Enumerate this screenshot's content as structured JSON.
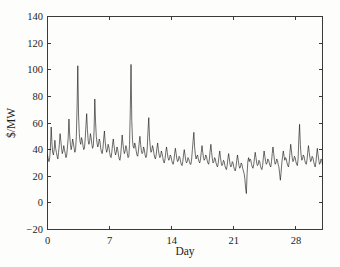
{
  "chart_data": {
    "type": "line",
    "title": "",
    "xlabel": "Day",
    "ylabel": "$/MW",
    "xlim": [
      0,
      31
    ],
    "ylim": [
      -20,
      140
    ],
    "xticks": [
      0,
      7,
      14,
      21,
      28
    ],
    "xticklabels": [
      "0",
      "7",
      "14",
      "21",
      "28"
    ],
    "yticks": [
      -20,
      0,
      20,
      40,
      60,
      80,
      100,
      120,
      140
    ],
    "yticklabels": [
      "-20",
      "0",
      "20",
      "40",
      "60",
      "80",
      "100",
      "120",
      "140"
    ],
    "grid": false,
    "legend": null,
    "legend_position": "none",
    "series": [
      {
        "name": "Electricity spot price",
        "color": "#121212",
        "x_start": 0,
        "x_step": 0.08333333,
        "values": [
          36,
          33,
          31,
          34,
          42,
          57,
          45,
          38,
          36,
          40,
          47,
          41,
          38,
          35,
          33,
          38,
          44,
          52,
          47,
          41,
          37,
          39,
          43,
          40,
          37,
          34,
          36,
          42,
          49,
          63,
          51,
          44,
          40,
          43,
          48,
          45,
          41,
          38,
          40,
          50,
          72,
          103,
          66,
          52,
          46,
          44,
          49,
          47,
          43,
          40,
          41,
          48,
          58,
          67,
          55,
          47,
          44,
          46,
          52,
          49,
          44,
          41,
          43,
          54,
          78,
          61,
          50,
          45,
          42,
          44,
          48,
          46,
          41,
          38,
          37,
          41,
          48,
          54,
          46,
          41,
          38,
          40,
          44,
          42,
          38,
          35,
          34,
          38,
          44,
          48,
          43,
          39,
          36,
          38,
          42,
          40,
          36,
          33,
          32,
          36,
          43,
          51,
          45,
          40,
          37,
          39,
          43,
          41,
          37,
          34,
          35,
          44,
          70,
          104,
          62,
          47,
          42,
          41,
          45,
          43,
          39,
          36,
          35,
          39,
          45,
          50,
          44,
          39,
          37,
          38,
          42,
          40,
          36,
          34,
          35,
          42,
          55,
          64,
          49,
          42,
          38,
          39,
          43,
          41,
          37,
          34,
          33,
          36,
          41,
          45,
          40,
          36,
          34,
          35,
          39,
          37,
          34,
          31,
          30,
          33,
          38,
          42,
          38,
          34,
          32,
          33,
          36,
          35,
          32,
          30,
          29,
          32,
          37,
          41,
          37,
          33,
          31,
          32,
          35,
          34,
          31,
          29,
          28,
          31,
          36,
          40,
          36,
          32,
          30,
          31,
          34,
          33,
          31,
          29,
          29,
          33,
          40,
          47,
          53,
          42,
          36,
          33,
          35,
          36,
          33,
          31,
          30,
          33,
          38,
          43,
          38,
          34,
          32,
          33,
          36,
          35,
          32,
          30,
          29,
          33,
          39,
          44,
          38,
          33,
          30,
          31,
          34,
          33,
          30,
          28,
          27,
          30,
          35,
          39,
          34,
          30,
          28,
          29,
          32,
          31,
          28,
          26,
          25,
          28,
          33,
          37,
          33,
          29,
          27,
          28,
          31,
          30,
          27,
          25,
          24,
          27,
          32,
          36,
          32,
          28,
          26,
          27,
          30,
          29,
          26,
          24,
          22,
          18,
          11,
          7,
          22,
          31,
          34,
          31,
          33,
          32,
          29,
          27,
          26,
          29,
          34,
          38,
          34,
          30,
          28,
          29,
          32,
          31,
          28,
          26,
          25,
          28,
          34,
          39,
          35,
          31,
          29,
          30,
          33,
          32,
          30,
          28,
          27,
          31,
          37,
          42,
          37,
          32,
          29,
          30,
          33,
          32,
          29,
          27,
          22,
          17,
          23,
          30,
          35,
          39,
          35,
          32,
          34,
          33,
          30,
          28,
          27,
          31,
          38,
          44,
          39,
          34,
          31,
          32,
          35,
          34,
          31,
          29,
          28,
          33,
          48,
          59,
          44,
          36,
          32,
          33,
          36,
          35,
          32,
          30,
          29,
          32,
          38,
          43,
          38,
          34,
          31,
          32,
          35,
          34,
          31,
          29,
          27,
          30,
          36,
          41,
          36,
          32,
          29,
          30,
          33,
          32,
          29,
          27,
          24,
          20,
          16,
          23,
          32,
          38,
          34,
          31,
          33,
          32,
          29,
          28,
          29,
          37,
          56,
          79,
          52,
          40,
          35,
          34,
          37,
          36,
          33,
          31,
          30,
          34,
          41,
          47,
          41,
          36,
          33,
          34,
          37,
          36,
          33,
          31,
          30,
          35,
          44,
          51,
          44,
          38,
          34,
          35,
          38,
          37,
          34,
          32,
          33,
          45,
          70,
          93,
          60,
          44,
          38,
          37,
          40,
          39,
          36,
          33,
          32,
          36,
          43,
          49,
          43,
          38,
          35,
          36,
          39,
          38,
          35,
          33,
          34,
          47,
          72,
          93,
          61,
          45,
          39,
          38,
          41,
          40,
          37,
          34,
          33,
          37,
          44,
          50,
          44,
          39,
          36,
          37,
          40,
          39,
          35,
          32,
          29,
          23,
          14,
          5,
          1,
          18,
          31,
          36,
          38,
          37,
          34,
          32,
          33,
          41,
          58,
          66,
          50,
          42,
          38,
          37,
          40,
          39,
          36,
          34,
          36,
          52,
          84,
          117,
          73,
          52,
          44,
          41,
          44,
          43,
          40,
          37,
          36,
          40,
          47,
          53,
          47,
          41,
          38,
          39,
          42,
          41,
          38,
          36,
          37,
          48,
          66,
          86,
          59,
          46,
          41,
          40,
          43,
          42,
          39,
          37,
          38,
          46,
          62,
          76,
          55,
          44,
          40,
          39,
          42,
          41,
          38,
          36,
          35,
          39,
          46,
          52,
          46,
          41,
          38,
          39,
          42,
          41,
          38,
          36,
          37,
          43,
          52,
          58,
          49,
          42,
          39,
          40,
          43,
          42,
          39,
          37,
          36,
          40,
          47,
          53,
          46,
          40,
          37,
          38,
          41,
          40,
          37,
          35,
          36,
          44,
          59,
          68,
          53,
          44,
          40,
          39,
          42,
          41,
          38,
          36,
          38,
          54,
          92,
          131,
          78,
          55,
          45,
          42,
          45,
          44,
          41,
          38,
          37,
          41,
          48,
          55,
          48,
          42,
          38,
          39,
          42,
          41,
          38,
          35,
          33,
          35,
          40,
          45,
          40,
          35,
          32,
          33,
          36,
          35,
          32,
          30,
          31,
          48,
          85,
          121,
          72,
          50,
          42,
          40,
          43,
          42,
          39,
          36,
          35,
          39,
          46,
          52,
          46,
          40,
          37,
          38,
          41,
          40,
          37,
          35,
          36,
          43,
          52,
          58,
          48,
          41,
          37,
          38,
          41,
          40,
          37,
          34,
          32,
          35,
          41,
          46,
          41,
          36,
          33,
          34,
          37,
          36,
          33,
          31,
          30,
          33,
          39,
          44,
          39,
          34,
          32,
          33,
          36,
          35,
          32,
          30,
          28,
          31,
          37,
          41,
          36,
          32,
          29,
          30,
          33,
          32,
          29,
          27,
          26,
          29,
          35,
          40,
          35,
          31,
          28,
          29,
          32,
          31,
          28,
          26,
          25,
          28,
          34,
          38,
          34,
          30,
          27,
          28,
          31,
          30,
          27,
          25,
          24,
          27,
          33,
          37,
          33,
          29,
          27,
          28,
          31,
          30,
          27,
          25,
          24,
          27,
          32,
          36,
          32,
          28,
          26,
          27,
          30,
          29,
          26,
          24,
          23,
          26,
          32,
          37,
          33,
          29,
          27,
          28,
          31,
          30,
          27,
          25,
          24,
          28,
          34,
          39,
          34,
          30,
          28,
          29,
          32,
          31,
          28,
          26,
          23,
          18,
          13,
          21,
          30,
          36,
          33,
          30,
          32,
          31,
          28,
          26,
          25,
          28,
          34,
          39,
          35,
          31,
          28,
          29,
          32,
          31,
          28,
          26,
          26,
          30,
          37,
          43,
          38,
          33,
          30,
          31,
          34,
          33,
          30,
          28,
          27,
          31,
          38,
          43,
          38,
          33,
          30,
          31,
          34,
          33,
          30,
          28,
          25,
          20,
          14,
          6,
          20,
          32,
          36,
          33,
          35,
          34,
          31,
          29,
          29,
          33,
          41,
          47,
          41,
          36,
          33,
          34,
          37,
          36,
          33,
          31,
          32,
          39,
          51,
          57,
          47,
          40,
          36,
          37,
          40,
          39,
          36,
          34,
          33,
          37,
          44,
          50,
          44,
          39,
          36,
          37,
          40,
          39,
          36,
          34,
          35,
          41,
          50,
          56,
          48,
          41,
          38,
          39,
          42,
          41,
          38,
          36,
          35,
          39,
          46,
          51,
          45,
          40,
          37,
          38,
          41,
          40,
          37,
          35,
          36,
          43,
          55,
          62,
          50,
          42,
          38,
          39,
          42,
          41,
          38,
          36,
          37,
          48,
          74,
          102,
          66,
          49,
          42,
          40,
          43,
          42,
          39,
          37,
          36,
          40,
          47,
          52,
          46,
          41,
          38,
          39,
          42,
          41,
          38,
          35,
          34,
          37,
          43,
          48,
          42,
          37,
          34,
          35,
          38,
          37,
          34,
          31,
          27,
          18,
          4,
          -17,
          12,
          29,
          34,
          33,
          35,
          34,
          31,
          29,
          29,
          34,
          43,
          50,
          44,
          38,
          35,
          36,
          39,
          38,
          35,
          33,
          34,
          42,
          56,
          65,
          52,
          43,
          39,
          38,
          41,
          40,
          37,
          34,
          33,
          36,
          42,
          47,
          41,
          36,
          33,
          34,
          37,
          36,
          33,
          31,
          30,
          33,
          39,
          43,
          38,
          34,
          31,
          32,
          35,
          34,
          31,
          29,
          28,
          31,
          37,
          41,
          36,
          32,
          29,
          30,
          33,
          32,
          29,
          27,
          25,
          27,
          32,
          36,
          32,
          28,
          26,
          27,
          30,
          29,
          27,
          25,
          26,
          32,
          42,
          48,
          41,
          35,
          31,
          32,
          35,
          34,
          31,
          29,
          28,
          32,
          39,
          44,
          39,
          34,
          31,
          32,
          35,
          34,
          31,
          28,
          25,
          20,
          12,
          8,
          22,
          31,
          34,
          32,
          34,
          33,
          30,
          28,
          28,
          32,
          40,
          45,
          40,
          35,
          32,
          33,
          36,
          35,
          32,
          30,
          31,
          37,
          46,
          52,
          45,
          39,
          35,
          36,
          39,
          38,
          35,
          33,
          34,
          38,
          44,
          47,
          42,
          37,
          34,
          35,
          38,
          37,
          34,
          32,
          33,
          39,
          48,
          54,
          46,
          39,
          36,
          37,
          40,
          39,
          36,
          34,
          33,
          36,
          42,
          46,
          41,
          36,
          33,
          34,
          37,
          36,
          33,
          31,
          32,
          36,
          42,
          45,
          40,
          36,
          33,
          34,
          37,
          36,
          33,
          31,
          30,
          34,
          40,
          44,
          39,
          35,
          32,
          33,
          36,
          35,
          32,
          30,
          31,
          35,
          41,
          45,
          40,
          35,
          32,
          33,
          36,
          35,
          32,
          30,
          29,
          33,
          39,
          43,
          38,
          34,
          31,
          32,
          35,
          34,
          31,
          29,
          30,
          34,
          40,
          44,
          39,
          35,
          32,
          33,
          36,
          35,
          32,
          30,
          31,
          35,
          41,
          44,
          39,
          34,
          31,
          32,
          35,
          34,
          31,
          29,
          30,
          34,
          40,
          43,
          38,
          34,
          31,
          32,
          35,
          34,
          31,
          29,
          28,
          32,
          38,
          42,
          37,
          33,
          30,
          31,
          34,
          33,
          30,
          28,
          29,
          33,
          39,
          42,
          37,
          33,
          30,
          31,
          34,
          33
        ]
      }
    ]
  }
}
